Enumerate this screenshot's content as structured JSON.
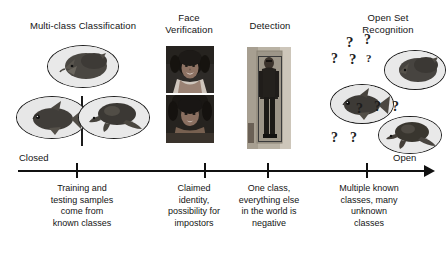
{
  "figure": {
    "type": "concept-diagram",
    "axis": {
      "left_label": "Closed",
      "right_label": "Open",
      "tick_count": 4
    },
    "columns": [
      {
        "key": "multiclass",
        "title": "Multi-class Classification",
        "caption": "Training and\ntesting samples\ncome from\nknown classes",
        "visual": "three-known-class-ellipses-with-divider",
        "ellipses": [
          {
            "name": "class-ellipse-hedgehog",
            "content": "hedgehog-image"
          },
          {
            "name": "class-ellipse-fish",
            "content": "goldfish-image"
          },
          {
            "name": "class-ellipse-turtle",
            "content": "turtle-image"
          }
        ]
      },
      {
        "key": "face_verification",
        "title": "Face\nVerification",
        "caption": "Claimed\nidentity,\npossibility for\nimpostors",
        "visual": "two-stacked-face-photos",
        "photos": [
          {
            "name": "face-photo-top",
            "content": "smiling-woman-portrait"
          },
          {
            "name": "face-photo-bottom",
            "content": "woman-portrait"
          }
        ]
      },
      {
        "key": "detection",
        "title": "Detection",
        "caption": "One class,\neverything else\nin the world is\nnegative",
        "visual": "person-photo-with-bounding-box",
        "photos": [
          {
            "name": "detection-photo",
            "content": "person-standing-in-doorway"
          }
        ]
      },
      {
        "key": "open_set",
        "title": "Open Set\nRecognition",
        "caption": "Multiple known\nclasses, many\nunknown\nclasses",
        "visual": "three-known-class-ellipses-with-question-marks",
        "ellipses": [
          {
            "name": "class-ellipse-hedgehog",
            "content": "hedgehog-image"
          },
          {
            "name": "class-ellipse-fish",
            "content": "goldfish-image"
          },
          {
            "name": "class-ellipse-turtle",
            "content": "turtle-image"
          }
        ],
        "unknown_marker": "?"
      }
    ],
    "colors": {
      "ink": "#141414",
      "axis": "#111111",
      "background": "#ffffff",
      "bubble_fill": "#efefef"
    }
  }
}
